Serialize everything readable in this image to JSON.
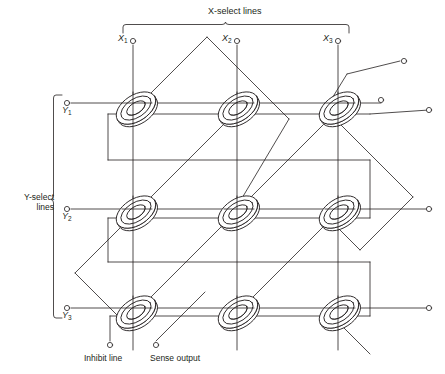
{
  "figure": {
    "type": "magnetic-core-memory-plane",
    "title_top": "X-select lines",
    "label_y_select": "Y-select\nlines",
    "label_y_select_line1": "Y-select",
    "label_y_select_line2": "lines",
    "label_inhibit": "Inhibit line",
    "label_sense": "Sense output",
    "stroke_color": "#231f20",
    "background_color": "#ffffff",
    "grid": {
      "rows": 3,
      "cols": 3,
      "cores": 9
    },
    "x_lines": [
      {
        "name": "X1",
        "base": "X",
        "sub": "1",
        "x": 133,
        "terminal_y": 40
      },
      {
        "name": "X2",
        "base": "X",
        "sub": "2",
        "x": 237,
        "terminal_y": 40
      },
      {
        "name": "X3",
        "base": "X",
        "sub": "3",
        "x": 338,
        "terminal_y": 40
      }
    ],
    "y_lines": [
      {
        "name": "Y1",
        "base": "Y",
        "sub": "1",
        "y": 103,
        "terminal_x": 67
      },
      {
        "name": "Y2",
        "base": "Y",
        "sub": "2",
        "y": 209,
        "terminal_x": 67
      },
      {
        "name": "Y3",
        "base": "Y",
        "sub": "3",
        "y": 308,
        "terminal_x": 67
      }
    ],
    "core_positions": [
      {
        "row": 1,
        "col": 1,
        "cx": 136,
        "cy": 108
      },
      {
        "row": 1,
        "col": 2,
        "cx": 238,
        "cy": 108
      },
      {
        "row": 1,
        "col": 3,
        "cx": 339,
        "cy": 108
      },
      {
        "row": 2,
        "col": 1,
        "cx": 136,
        "cy": 212
      },
      {
        "row": 2,
        "col": 2,
        "cx": 238,
        "cy": 212
      },
      {
        "row": 2,
        "col": 3,
        "cx": 339,
        "cy": 212
      },
      {
        "row": 3,
        "col": 1,
        "cx": 136,
        "cy": 312
      },
      {
        "row": 3,
        "col": 2,
        "cx": 238,
        "cy": 312
      },
      {
        "row": 3,
        "col": 3,
        "cx": 339,
        "cy": 312
      }
    ],
    "terminals_right": [
      {
        "name": "sense-return-top",
        "x": 404,
        "y": 61
      },
      {
        "name": "y1-right",
        "x": 381,
        "y": 100
      },
      {
        "name": "inhibit-right",
        "x": 429,
        "y": 110
      },
      {
        "name": "y2-right",
        "x": 429,
        "y": 203
      },
      {
        "name": "y3-right",
        "x": 429,
        "y": 303
      }
    ],
    "terminals_bottom": [
      {
        "name": "inhibit-line",
        "x": 110,
        "y": 345
      },
      {
        "name": "sense-output",
        "x": 156,
        "y": 345
      }
    ]
  }
}
